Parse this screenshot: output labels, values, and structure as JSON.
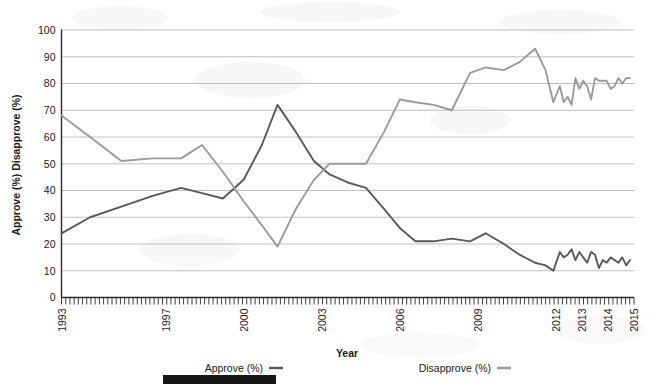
{
  "chart_data": {
    "type": "line",
    "title": "",
    "xlabel": "Year",
    "ylabel": "Approve (%) Disapprove (%)",
    "ylim": [
      0,
      100
    ],
    "xlim": [
      1993,
      2015
    ],
    "ytick_labels": [
      "0",
      "10",
      "20",
      "30",
      "40",
      "50",
      "60",
      "70",
      "80",
      "90",
      "100"
    ],
    "ytick_values": [
      0,
      10,
      20,
      30,
      40,
      50,
      60,
      70,
      80,
      90,
      100
    ],
    "xtick_labels": [
      "1993",
      "1997",
      "2000",
      "2003",
      "2006",
      "2009",
      "2012",
      "2013",
      "2014",
      "2015"
    ],
    "xtick_values": [
      1993,
      1997,
      2000,
      2003,
      2006,
      2009,
      2012,
      2013,
      2014,
      2015
    ],
    "grid": "horizontal",
    "legend_position": "bottom",
    "series": [
      {
        "name": "Approve (%)",
        "color": "#595959",
        "x": [
          1993.0,
          1994.1,
          1995.3,
          1996.5,
          1997.6,
          1998.4,
          1999.2,
          2000.0,
          2000.7,
          2001.3,
          2002.0,
          2002.7,
          2003.3,
          2004.0,
          2004.7,
          2005.4,
          2006.0,
          2006.6,
          2007.3,
          2008.0,
          2008.7,
          2009.3,
          2010.0,
          2010.6,
          2011.2,
          2011.6,
          2011.9,
          2012.15,
          2012.3,
          2012.45,
          2012.6,
          2012.75,
          2012.9,
          2013.05,
          2013.2,
          2013.35,
          2013.5,
          2013.65,
          2013.8,
          2013.95,
          2014.1,
          2014.25,
          2014.4,
          2014.55,
          2014.7,
          2014.85
        ],
        "y": [
          24,
          30,
          34,
          38,
          41,
          39,
          37,
          44,
          57,
          72,
          62,
          51,
          46,
          43,
          41,
          33,
          26,
          21,
          21,
          22,
          21,
          24,
          20,
          16,
          13,
          12,
          10,
          17,
          15,
          16,
          18,
          14,
          17,
          15,
          13,
          17,
          16,
          11,
          14,
          13,
          15,
          14,
          13,
          15,
          12,
          14
        ],
        "label_start_value": 24,
        "peak_value": 72,
        "peak_year": 2001
      },
      {
        "name": "Disapprove (%)",
        "color": "#9a9a9a",
        "x": [
          1993.0,
          1994.1,
          1995.3,
          1996.5,
          1997.6,
          1998.4,
          1999.2,
          2000.0,
          2000.7,
          2001.3,
          2002.0,
          2002.7,
          2003.3,
          2004.0,
          2004.7,
          2005.4,
          2006.0,
          2006.6,
          2007.3,
          2008.0,
          2008.7,
          2009.3,
          2010.0,
          2010.6,
          2011.2,
          2011.6,
          2011.9,
          2012.15,
          2012.3,
          2012.45,
          2012.6,
          2012.75,
          2012.9,
          2013.05,
          2013.2,
          2013.35,
          2013.5,
          2013.65,
          2013.8,
          2013.95,
          2014.1,
          2014.25,
          2014.4,
          2014.55,
          2014.7,
          2014.85
        ],
        "y": [
          68,
          60,
          51,
          52,
          52,
          57,
          47,
          36,
          27,
          19,
          33,
          44,
          50,
          50,
          50,
          62,
          74,
          73,
          72,
          70,
          84,
          86,
          85,
          88,
          93,
          85,
          73,
          79,
          73,
          75,
          72,
          82,
          78,
          81,
          79,
          74,
          82,
          81,
          81,
          81,
          78,
          79,
          82,
          80,
          82,
          82
        ],
        "label_start_value": 68,
        "peak_value": 93,
        "peak_year": 2011
      }
    ]
  },
  "legend": {
    "items": [
      {
        "label": "Approve (%)",
        "color": "#595959"
      },
      {
        "label": "Disapprove (%)",
        "color": "#9a9a9a"
      }
    ]
  },
  "footer": {
    "redaction_bar": ""
  }
}
